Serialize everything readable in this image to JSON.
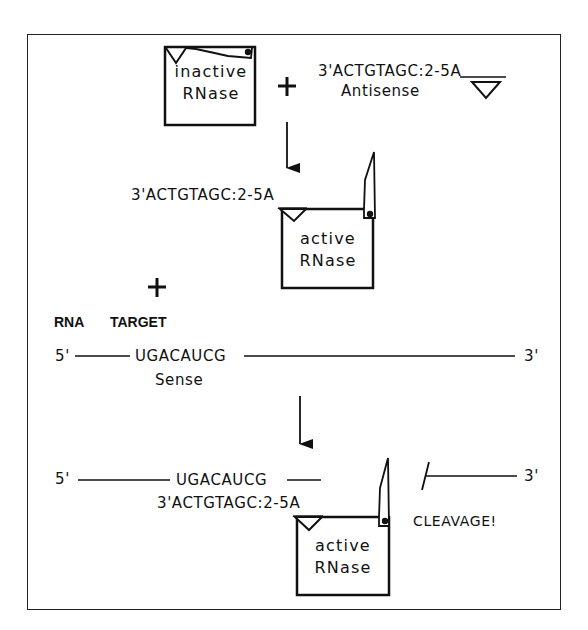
{
  "diagram": {
    "step1": {
      "enzyme_state": "inactive",
      "enzyme_name": "RNase",
      "operator": "+",
      "antisense_sequence": "3'ACTGTAGC:",
      "antisense_tail": "2-5A",
      "antisense_label": "Antisense"
    },
    "step2": {
      "antisense_sequence": "3'ACTGTAGC:",
      "antisense_tail": "2-5A",
      "enzyme_state": "active",
      "enzyme_name": "RNase",
      "operator": "+",
      "target_label_1": "RNA",
      "target_label_2": "TARGET",
      "sense_5prime": "5'",
      "sense_sequence": "UGACAUCG",
      "sense_3prime": "3'",
      "sense_label": "Sense"
    },
    "step3": {
      "sense_5prime": "5'",
      "sense_sequence": "UGACAUCG",
      "antisense_sequence": "3'ACTGTAGC:",
      "antisense_tail": "2-5A",
      "enzyme_state": "active",
      "enzyme_name": "RNase",
      "fragment_3prime": "3'",
      "cleavage_label": "CLEAVAGE!"
    }
  },
  "colors": {
    "ink": "#111111",
    "background": "#ffffff"
  }
}
